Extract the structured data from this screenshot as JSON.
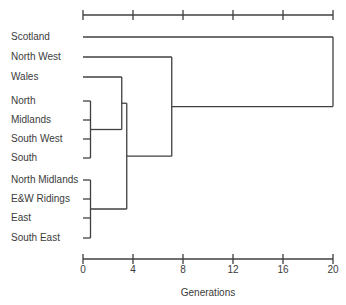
{
  "chart_data": {
    "type": "dendrogram",
    "orientation": "horizontal-right",
    "leaves": [
      "Scotland",
      "North West",
      "Wales",
      "North",
      "Midlands",
      "South West",
      "South",
      "North Midlands",
      "E&W Ridings",
      "East",
      "South East"
    ],
    "tree": {
      "h": 20,
      "children": [
        {
          "leaf": 0
        },
        {
          "h": 7.1,
          "children": [
            {
              "leaf": 1
            },
            {
              "h": 3.5,
              "children": [
                {
                  "h": 3.1,
                  "children": [
                    {
                      "leaf": 2
                    },
                    {
                      "h": 0.6,
                      "children": [
                        {
                          "leaf": 3
                        },
                        {
                          "leaf": 4
                        },
                        {
                          "leaf": 5
                        },
                        {
                          "leaf": 6
                        }
                      ]
                    }
                  ]
                },
                {
                  "h": 0.6,
                  "children": [
                    {
                      "leaf": 7
                    },
                    {
                      "leaf": 8
                    },
                    {
                      "leaf": 9
                    },
                    {
                      "leaf": 10
                    }
                  ]
                }
              ]
            }
          ]
        }
      ]
    },
    "axis": {
      "label": "Generations",
      "ticks": [
        "0",
        "4",
        "8",
        "12",
        "16",
        "20"
      ],
      "tick_values": [
        0,
        4,
        8,
        12,
        16,
        20
      ],
      "range": [
        0,
        20
      ],
      "top_axis": true,
      "bottom_axis": true,
      "grid": false
    },
    "colors": {
      "line": "#404040",
      "text": "#3b3b3b",
      "background": "#ffffff"
    }
  }
}
